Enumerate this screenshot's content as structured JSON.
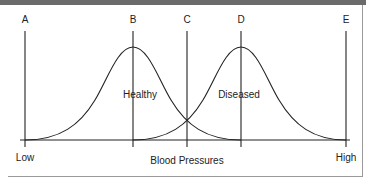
{
  "diagram": {
    "markers": [
      {
        "id": "A",
        "label": "A"
      },
      {
        "id": "B",
        "label": "B"
      },
      {
        "id": "C",
        "label": "C"
      },
      {
        "id": "D",
        "label": "D"
      },
      {
        "id": "E",
        "label": "E"
      }
    ],
    "curves": [
      {
        "name": "healthy",
        "label": "Healthy"
      },
      {
        "name": "diseased",
        "label": "Diseased"
      }
    ],
    "axis": {
      "title": "Blood Pressures",
      "low_label": "Low",
      "high_label": "High"
    },
    "colors": {
      "line": "#222222",
      "topbar": "#6b6b6b",
      "frame": "#9a9a9a"
    }
  }
}
